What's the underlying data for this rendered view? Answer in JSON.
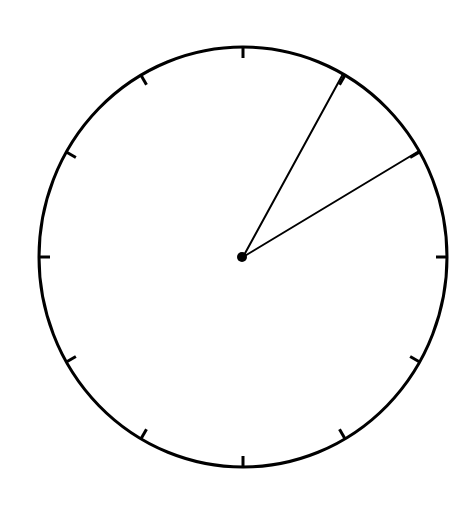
{
  "clock": {
    "type": "analog-clock-face",
    "center": {
      "x": 243,
      "y": 257
    },
    "radius_x": 204,
    "radius_y": 210,
    "stroke_color": "#000000",
    "background_color": "#ffffff",
    "tick_count": 12,
    "tick_length": 11,
    "hands": [
      {
        "name": "hand-a",
        "end": {
          "x": 343,
          "y": 74
        },
        "angle_from_12_deg": 29
      },
      {
        "name": "hand-b",
        "end": {
          "x": 419,
          "y": 151
        },
        "angle_from_12_deg": 59
      }
    ],
    "center_dot_radius": 5
  }
}
